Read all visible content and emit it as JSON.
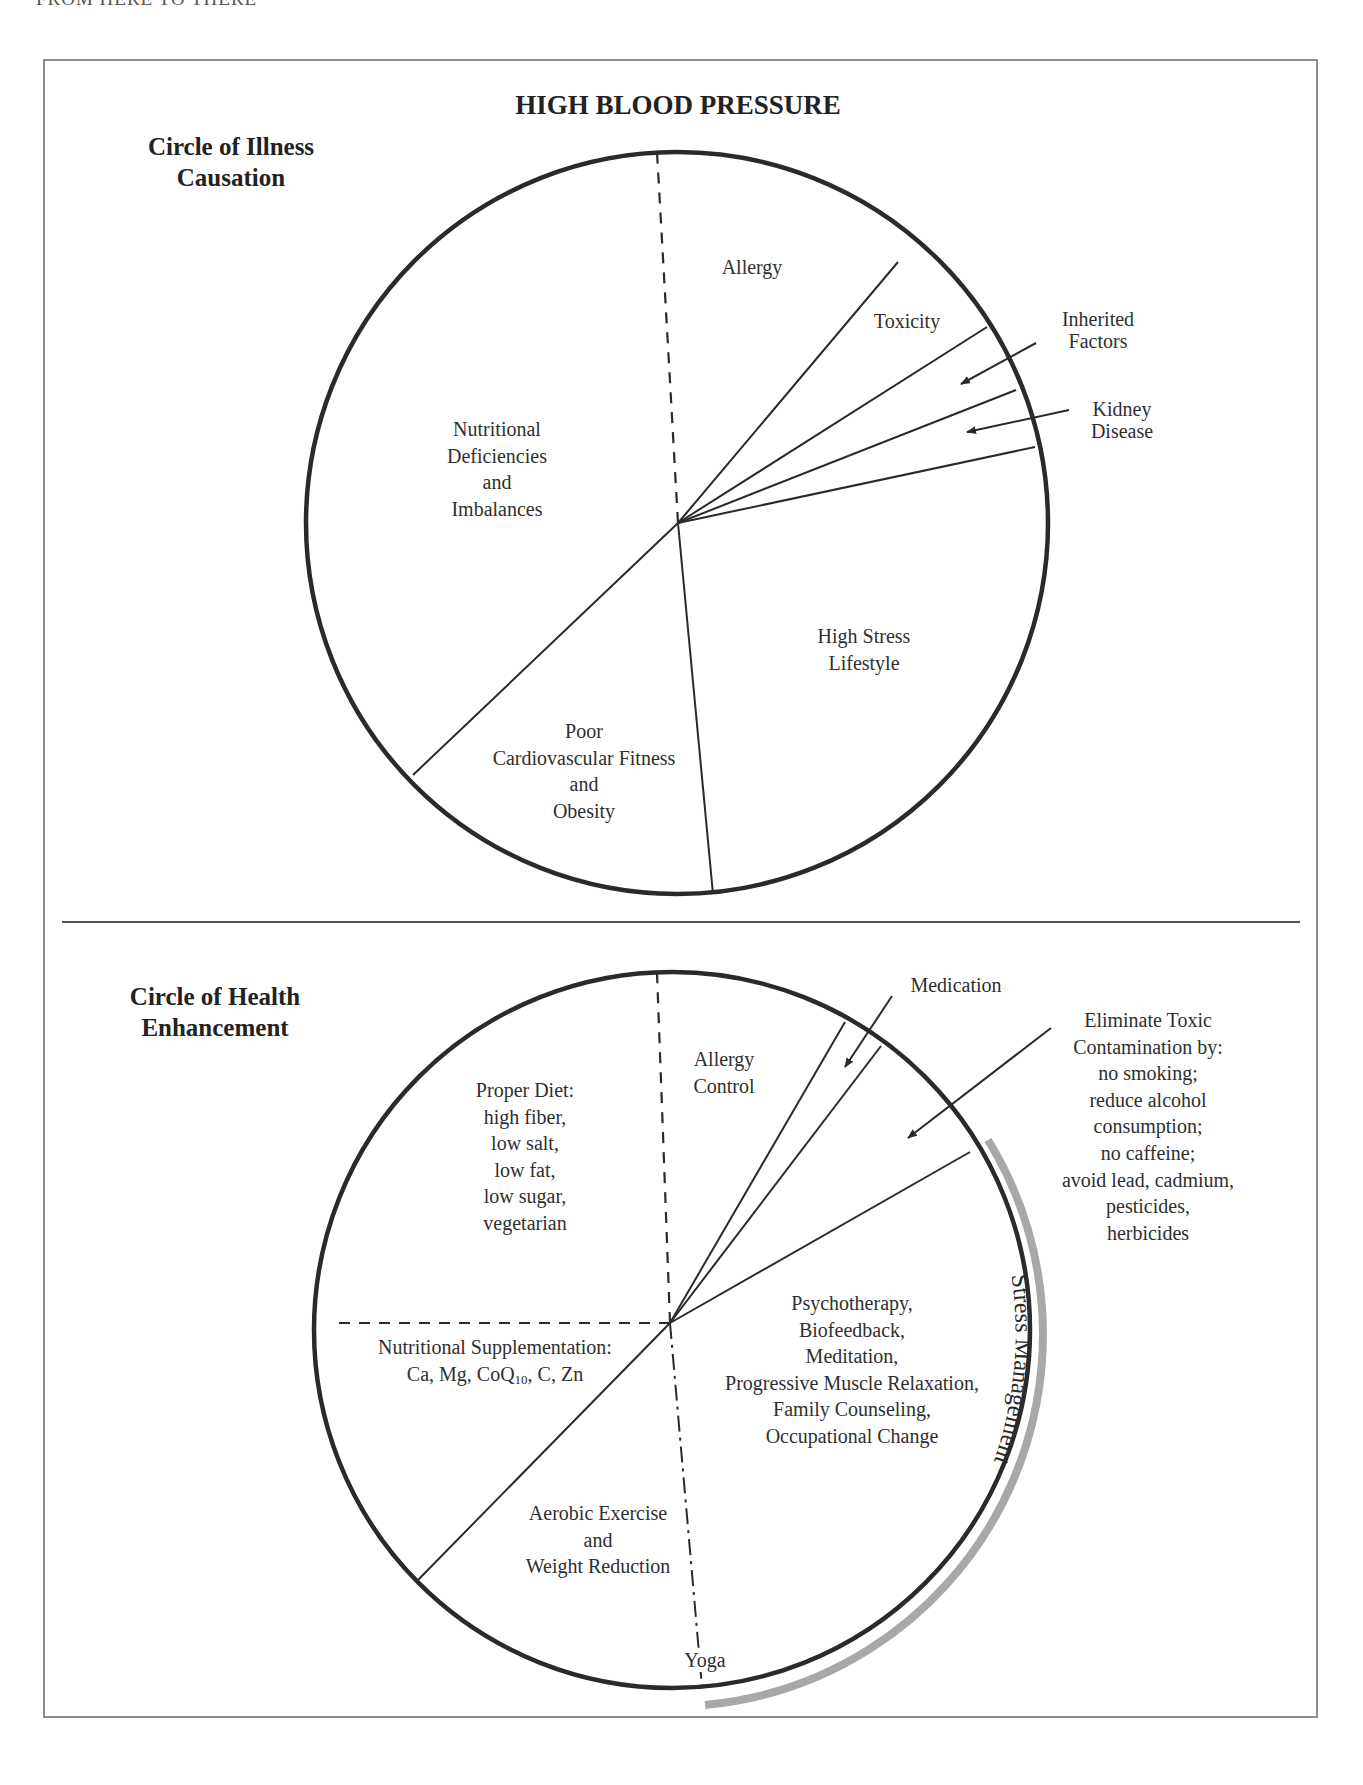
{
  "running_head": "FROM HERE TO THERE",
  "title": "HIGH BLOOD PRESSURE",
  "illness": {
    "heading": [
      "Circle of Illness",
      "Causation"
    ],
    "segments": [
      {
        "name": "allergy",
        "lines": [
          "Allergy"
        ]
      },
      {
        "name": "toxicity",
        "lines": [
          "Toxicity"
        ]
      },
      {
        "name": "inherited-factors",
        "lines": [
          "Inherited",
          "Factors"
        ]
      },
      {
        "name": "kidney-disease",
        "lines": [
          "Kidney",
          "Disease"
        ]
      },
      {
        "name": "nutritional",
        "lines": [
          "Nutritional",
          "Deficiencies",
          "and",
          "Imbalances"
        ]
      },
      {
        "name": "high-stress",
        "lines": [
          "High Stress",
          "Lifestyle"
        ]
      },
      {
        "name": "poor-fitness",
        "lines": [
          "Poor",
          "Cardiovascular Fitness",
          "and",
          "Obesity"
        ]
      }
    ]
  },
  "health": {
    "heading": [
      "Circle of Health",
      "Enhancement"
    ],
    "segments": [
      {
        "name": "allergy-control",
        "lines": [
          "Allergy",
          "Control"
        ]
      },
      {
        "name": "medication",
        "lines": [
          "Medication"
        ]
      },
      {
        "name": "eliminate-toxic",
        "lines": [
          "Eliminate Toxic",
          "Contamination by:",
          "no smoking;",
          "reduce alcohol",
          "consumption;",
          "no caffeine;",
          "avoid lead, cadmium,",
          "pesticides,",
          "herbicides"
        ]
      },
      {
        "name": "proper-diet",
        "lines": [
          "Proper Diet:",
          "high fiber,",
          "low salt,",
          "low fat,",
          "low sugar,",
          "vegetarian"
        ]
      },
      {
        "name": "nutritional-supplementation",
        "lines": [
          "Nutritional Supplementation:",
          "Ca, Mg, CoQ",
          "10",
          ", C, Zn"
        ]
      },
      {
        "name": "stress-therapies",
        "lines": [
          "Psychotherapy,",
          "Biofeedback,",
          "Meditation,",
          "Progressive Muscle Relaxation,",
          "Family Counseling,",
          "Occupational Change"
        ]
      },
      {
        "name": "aerobic-exercise",
        "lines": [
          "Aerobic Exercise",
          "and",
          "Weight Reduction"
        ]
      },
      {
        "name": "yoga",
        "lines": [
          "Yoga"
        ]
      }
    ],
    "arc_label": "Stress Management"
  },
  "colors": {
    "ink": "#2a2a2a",
    "frame": "#8c8c8c",
    "arc": "#a8a8a8"
  }
}
